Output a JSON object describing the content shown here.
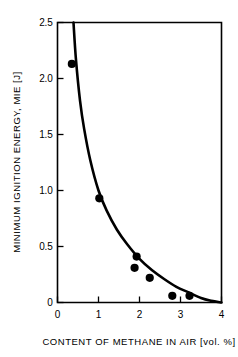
{
  "chart_data": {
    "type": "scatter",
    "title": "",
    "subtitle": "",
    "xlabel": "CONTENT OF METHANE IN AIR [vol. %]",
    "ylabel": "MINIMUM IGNITION ENERGY, MIE [J]",
    "xlim": [
      0,
      4
    ],
    "ylim": [
      0,
      2.5
    ],
    "grid": false,
    "legend": null,
    "x_ticks": [
      0,
      1,
      2,
      3,
      4
    ],
    "x_tick_labels": [
      "0",
      "1",
      "2",
      "3",
      "4"
    ],
    "y_ticks": [
      0,
      0.5,
      1.0,
      1.5,
      2.0,
      2.5
    ],
    "y_tick_labels": [
      "0",
      "0.5",
      "1.0",
      "1.5",
      "2.0",
      "2.5"
    ],
    "series": [
      {
        "name": "measured points",
        "kind": "scatter",
        "marker": "filled-circle",
        "color": "#000000",
        "points": [
          {
            "x": 0.35,
            "y": 2.13
          },
          {
            "x": 1.02,
            "y": 0.93
          },
          {
            "x": 1.93,
            "y": 0.41
          },
          {
            "x": 1.88,
            "y": 0.31
          },
          {
            "x": 2.25,
            "y": 0.22
          },
          {
            "x": 2.8,
            "y": 0.06
          },
          {
            "x": 3.22,
            "y": 0.06
          }
        ]
      },
      {
        "name": "fitted curve",
        "kind": "line",
        "color": "#000000",
        "points": [
          {
            "x": 0.39,
            "y": 2.5
          },
          {
            "x": 0.45,
            "y": 2.17
          },
          {
            "x": 0.55,
            "y": 1.8
          },
          {
            "x": 0.65,
            "y": 1.55
          },
          {
            "x": 0.8,
            "y": 1.27
          },
          {
            "x": 1.0,
            "y": 1.0
          },
          {
            "x": 1.2,
            "y": 0.82
          },
          {
            "x": 1.45,
            "y": 0.65
          },
          {
            "x": 1.7,
            "y": 0.52
          },
          {
            "x": 2.0,
            "y": 0.39
          },
          {
            "x": 2.3,
            "y": 0.29
          },
          {
            "x": 2.6,
            "y": 0.21
          },
          {
            "x": 2.9,
            "y": 0.14
          },
          {
            "x": 3.2,
            "y": 0.09
          },
          {
            "x": 3.5,
            "y": 0.04
          },
          {
            "x": 3.75,
            "y": 0.015
          },
          {
            "x": 4.0,
            "y": 0.0
          }
        ]
      }
    ]
  },
  "figure": {
    "background_color": "#ffffff",
    "ink_color": "#000000"
  }
}
